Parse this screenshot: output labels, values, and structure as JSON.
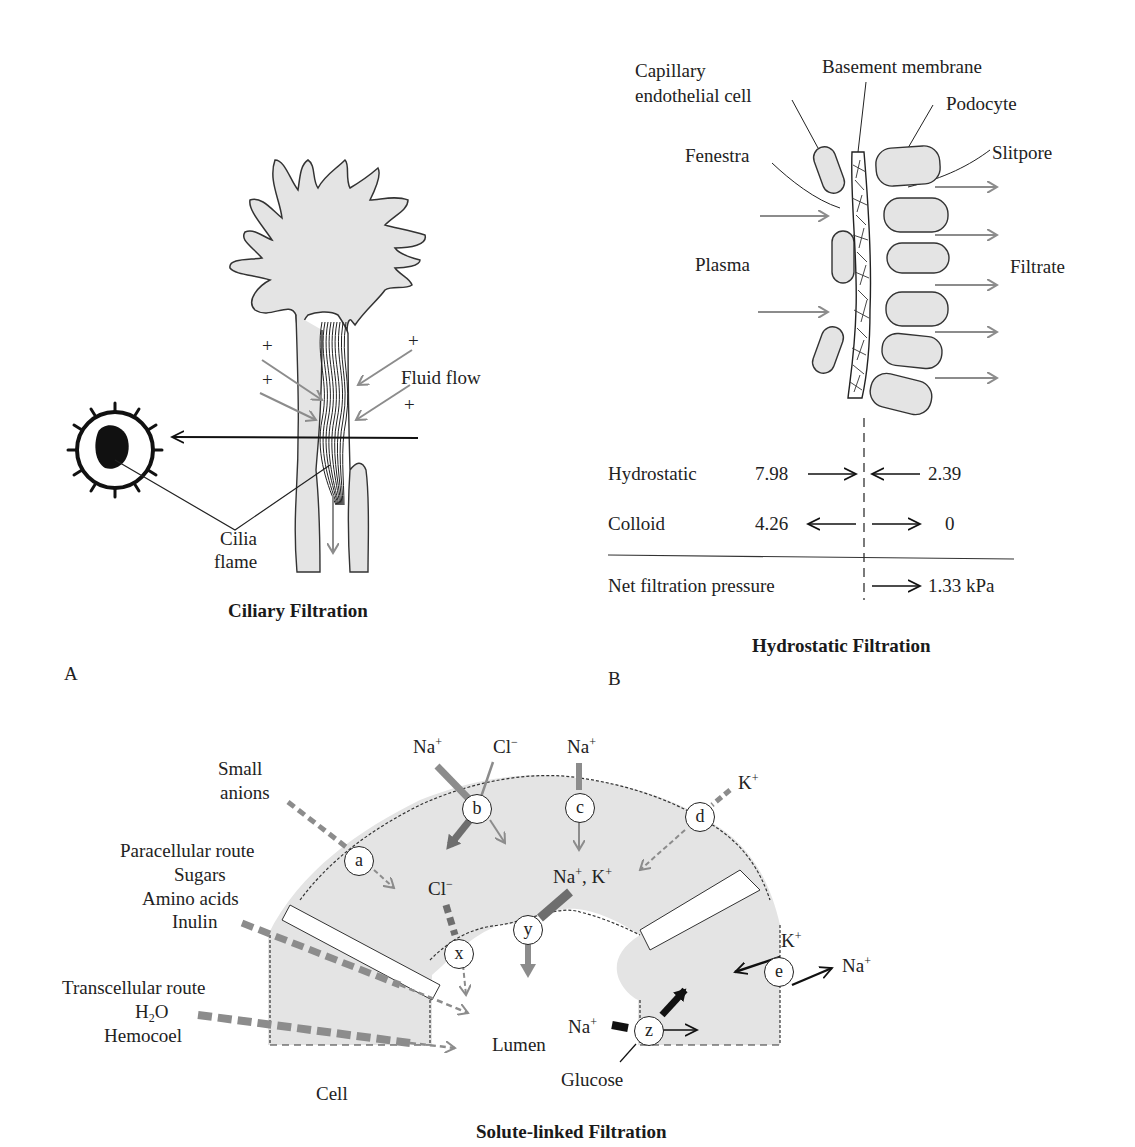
{
  "panels": {
    "A": {
      "letter": "A",
      "title": "Ciliary Filtration",
      "labels": {
        "fluid_flow": "Fluid flow",
        "cilia": "Cilia",
        "flame": "flame",
        "plus": "+",
        "minus": "−"
      }
    },
    "B": {
      "letter": "B",
      "title": "Hydrostatic Filtration",
      "labels": {
        "capillary": "Capillary",
        "endothelial": "endothelial cell",
        "basement_membrane": "Basement membrane",
        "podocyte": "Podocyte",
        "fenestra": "Fenestra",
        "slitpore": "Slitpore",
        "plasma": "Plasma",
        "filtrate": "Filtrate"
      },
      "pressures": {
        "rows": [
          {
            "name": "Hydrostatic",
            "left_value": "7.98",
            "left_dir": "→",
            "right_dir": "←",
            "right_value": "2.39"
          },
          {
            "name": "Colloid",
            "left_value": "4.26",
            "left_dir": "←",
            "right_dir": "→",
            "right_value": "0"
          }
        ],
        "net": {
          "name": "Net filtration pressure",
          "dir": "→",
          "value": "1.33 kPa"
        }
      }
    },
    "C": {
      "title": "Solute-linked Filtration",
      "labels": {
        "small": "Small",
        "anions": "anions",
        "paracellular": "Paracellular route",
        "sugars": "Sugars",
        "amino_acids": "Amino acids",
        "inulin": "Inulin",
        "transcellular": "Transcellular route",
        "h2o_h": "H",
        "h2o_sub": "2",
        "h2o_o": "O",
        "hemocoel": "Hemocoel",
        "cell": "Cell",
        "lumen": "Lumen",
        "glucose": "Glucose",
        "na": "Na",
        "cl": "Cl",
        "k": "K",
        "plus": "+",
        "minus": "−",
        "comma": ", "
      },
      "transporters": [
        "a",
        "b",
        "c",
        "d",
        "e",
        "x",
        "y",
        "z"
      ]
    }
  },
  "colors": {
    "cell_fill": "#e4e4e4",
    "outline": "#333333",
    "gray_arrow": "#8c8c8c",
    "dark_gray_arrow": "#6e6e6e",
    "black": "#111111"
  }
}
